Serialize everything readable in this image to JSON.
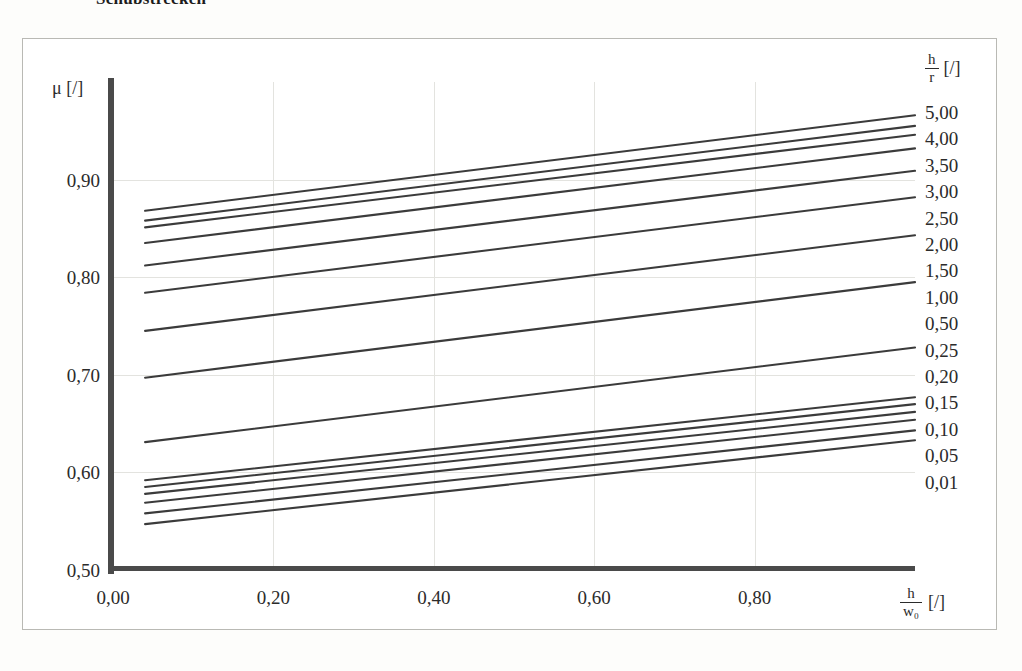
{
  "heading": "Schubstrecken",
  "frame": {
    "border_color": "#b9b9b4",
    "background": "#ffffff"
  },
  "axes": {
    "y_title_symbol": "μ",
    "y_title_unit": "[/]",
    "x_title_num": "h",
    "x_title_den": "w₀",
    "x_title_unit": "[/]",
    "y_ticks": [
      "0,90",
      "0,80",
      "0,70",
      "0,60",
      "0,50"
    ],
    "x_ticks": [
      "0,00",
      "0,20",
      "0,40",
      "0,60",
      "0,80"
    ],
    "axis_color": "#4a4a4a",
    "grid_color": "#e3e3df"
  },
  "legend": {
    "title_num": "h",
    "title_den": "r",
    "title_unit": "[/]",
    "items": [
      "5,00",
      "4,00",
      "3,50",
      "3,00",
      "2,50",
      "2,00",
      "1,50",
      "1,00",
      "0,50",
      "0,25",
      "0,20",
      "0,15",
      "0,10",
      "0,05",
      "0,01"
    ]
  },
  "chart_data": {
    "type": "line",
    "title": "Schubstrecken",
    "xlabel": "h/w0 [/]",
    "ylabel": "μ [/]",
    "xlim": [
      0.0,
      1.0
    ],
    "ylim": [
      0.5,
      1.0
    ],
    "xticks": [
      0.0,
      0.2,
      0.4,
      0.6,
      0.8
    ],
    "yticks": [
      0.5,
      0.6,
      0.7,
      0.8,
      0.9
    ],
    "grid": true,
    "legend_position": "right",
    "legend_title": "h/r [/]",
    "x_domain_drawn": [
      0.04,
      1.0
    ],
    "stroke_color": "#3b3b3b",
    "series": [
      {
        "name": "5,00",
        "x": [
          0.04,
          1.0
        ],
        "y": [
          0.868,
          0.966
        ]
      },
      {
        "name": "4,00",
        "x": [
          0.04,
          1.0
        ],
        "y": [
          0.858,
          0.955
        ]
      },
      {
        "name": "3,50",
        "x": [
          0.04,
          1.0
        ],
        "y": [
          0.851,
          0.946
        ]
      },
      {
        "name": "3,00",
        "x": [
          0.04,
          1.0
        ],
        "y": [
          0.835,
          0.932
        ]
      },
      {
        "name": "2,50",
        "x": [
          0.04,
          1.0
        ],
        "y": [
          0.812,
          0.909
        ]
      },
      {
        "name": "2,00",
        "x": [
          0.04,
          1.0
        ],
        "y": [
          0.784,
          0.882
        ]
      },
      {
        "name": "1,50",
        "x": [
          0.04,
          1.0
        ],
        "y": [
          0.745,
          0.843
        ]
      },
      {
        "name": "1,00",
        "x": [
          0.04,
          1.0
        ],
        "y": [
          0.697,
          0.795
        ]
      },
      {
        "name": "0,50",
        "x": [
          0.04,
          1.0
        ],
        "y": [
          0.631,
          0.728
        ]
      },
      {
        "name": "0,25",
        "x": [
          0.04,
          1.0
        ],
        "y": [
          0.592,
          0.677
        ]
      },
      {
        "name": "0,20",
        "x": [
          0.04,
          1.0
        ],
        "y": [
          0.585,
          0.67
        ]
      },
      {
        "name": "0,15",
        "x": [
          0.04,
          1.0
        ],
        "y": [
          0.578,
          0.662
        ]
      },
      {
        "name": "0,10",
        "x": [
          0.04,
          1.0
        ],
        "y": [
          0.569,
          0.654
        ]
      },
      {
        "name": "0,05",
        "x": [
          0.04,
          1.0
        ],
        "y": [
          0.558,
          0.643
        ]
      },
      {
        "name": "0,01",
        "x": [
          0.04,
          1.0
        ],
        "y": [
          0.547,
          0.633
        ]
      }
    ]
  }
}
